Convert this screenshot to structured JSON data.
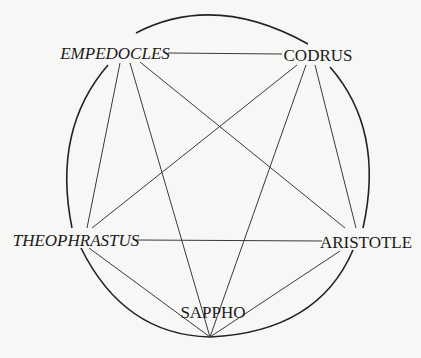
{
  "diagram": {
    "type": "complete-graph-in-circle",
    "nodes": [
      {
        "id": "empedocles",
        "label": "EMPEDOCLES",
        "italic": true,
        "x": 115,
        "y": 59
      },
      {
        "id": "codrus",
        "label": "CODRUS",
        "italic": false,
        "x": 318,
        "y": 61
      },
      {
        "id": "theophrastus",
        "label": "THEOPHRASTUS",
        "italic": true,
        "x": 76,
        "y": 246
      },
      {
        "id": "aristotle",
        "label": "ARISTOTLE",
        "italic": false,
        "x": 366,
        "y": 248
      },
      {
        "id": "sappho",
        "label": "SAPPHO",
        "italic": false,
        "x": 213,
        "y": 318
      }
    ],
    "edges": [
      [
        "empedocles",
        "codrus"
      ],
      [
        "empedocles",
        "theophrastus"
      ],
      [
        "empedocles",
        "sappho"
      ],
      [
        "empedocles",
        "aristotle"
      ],
      [
        "codrus",
        "theophrastus"
      ],
      [
        "codrus",
        "sappho"
      ],
      [
        "codrus",
        "aristotle"
      ],
      [
        "theophrastus",
        "aristotle"
      ],
      [
        "theophrastus",
        "sappho"
      ],
      [
        "aristotle",
        "sappho"
      ]
    ],
    "colors": {
      "background": "#f7f7f5",
      "line": "#3a3a3a",
      "text": "#1a1a1a"
    }
  },
  "labels": {
    "empedocles": "EMPEDOCLES",
    "codrus": "CODRUS",
    "theophrastus": "THEOPHRASTUS",
    "aristotle": "ARISTOTLE",
    "sappho": "SAPPHO"
  }
}
